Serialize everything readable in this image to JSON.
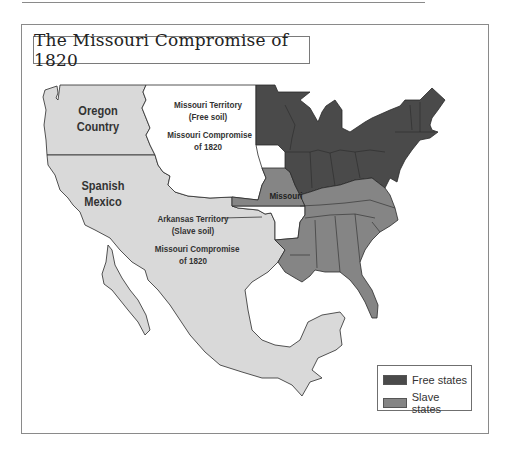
{
  "map": {
    "title": "The Missouri Compromise of 1820",
    "regions": {
      "oregon": {
        "line1": "Oregon",
        "line2": "Country"
      },
      "spanish_mexico": {
        "line1": "Spanish",
        "line2": "Mexico"
      },
      "missouri_territory": {
        "line1": "Missouri Territory",
        "line2": "(Free soil)",
        "line3": "Missouri Compromise",
        "line4": "of 1820"
      },
      "arkansas_territory": {
        "line1": "Arkansas Territory",
        "line2": "(Slave soil)",
        "line3": "Missouri Compromise",
        "line4": "of 1820"
      },
      "missouri_state": {
        "label": "Missouri"
      }
    },
    "legend": {
      "items": [
        {
          "label": "Free states",
          "color": "#4a4a4a"
        },
        {
          "label": "Slave states",
          "color": "#858585"
        }
      ]
    },
    "colors": {
      "free": "#4a4a4a",
      "slave": "#858585",
      "spanish": "#d9d9d9",
      "territory_free": "#ffffff",
      "border": "#2a2a2a"
    }
  }
}
